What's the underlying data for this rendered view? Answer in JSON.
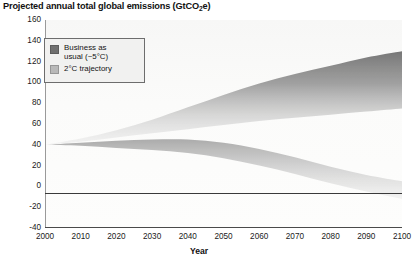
{
  "title": {
    "prefix": "Projected annual total global emissions (GtCO",
    "sub": "2",
    "suffix": "e)"
  },
  "legend": {
    "items": [
      {
        "label": "Business as\nusual (~5°C)",
        "color": "#6f6f6f",
        "name": "business-as-usual"
      },
      {
        "label": "2°C trajectory",
        "color": "#b8b8b8",
        "name": "two-degree-trajectory"
      }
    ]
  },
  "axes": {
    "x_label": "Year",
    "x_ticks": [
      "2000",
      "2010",
      "2020",
      "2030",
      "2040",
      "2050",
      "2060",
      "2070",
      "2080",
      "2090",
      "2100"
    ],
    "y_ticks": [
      "160",
      "140",
      "120",
      "100",
      "80",
      "60",
      "40",
      "20",
      "0",
      "-20",
      "-40"
    ]
  },
  "chart_data": {
    "type": "area",
    "title": "Projected annual total global emissions (GtCO2e)",
    "xlabel": "Year",
    "ylabel": "GtCO2e",
    "xlim": [
      2000,
      2100
    ],
    "ylim": [
      -40,
      160
    ],
    "grid": false,
    "legend_position": "top-left",
    "x": [
      2000,
      2010,
      2020,
      2030,
      2040,
      2050,
      2060,
      2070,
      2080,
      2090,
      2100
    ],
    "series": [
      {
        "name": "Business as usual (~5°C)",
        "type": "band",
        "color": "#6f6f6f",
        "upper": [
          40,
          46,
          54,
          64,
          76,
          88,
          99,
          108,
          116,
          124,
          130
        ],
        "lower": [
          40,
          43,
          47,
          51,
          55,
          59,
          63,
          66,
          69,
          72,
          75
        ]
      },
      {
        "name": "2°C trajectory",
        "type": "band",
        "color": "#b8b8b8",
        "upper": [
          40,
          42,
          44,
          45,
          45,
          42,
          36,
          28,
          19,
          11,
          5
        ],
        "lower": [
          40,
          39,
          37,
          35,
          32,
          27,
          20,
          12,
          3,
          -5,
          -12
        ]
      }
    ]
  }
}
